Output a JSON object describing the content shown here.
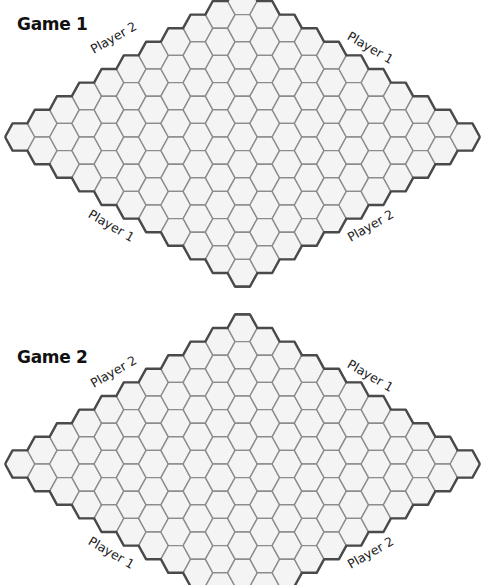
{
  "page": {
    "background": "#ffffff"
  },
  "board_style": {
    "size": 11,
    "cell_fill": "#f4f4f4",
    "cell_stroke": "#8c8c8c",
    "border_stroke": "#4a4a4a"
  },
  "games": [
    {
      "title": "Game 1",
      "center_y": 137,
      "labels": {
        "top_left": "Player 2",
        "top_right": "Player 1",
        "bottom_left": "Player 1",
        "bottom_right": "Player 2"
      }
    },
    {
      "title": "Game 2",
      "center_y": 464,
      "labels": {
        "top_left": "Player 2",
        "top_right": "Player 1",
        "bottom_left": "Player 1",
        "bottom_right": "Player 2"
      }
    }
  ]
}
